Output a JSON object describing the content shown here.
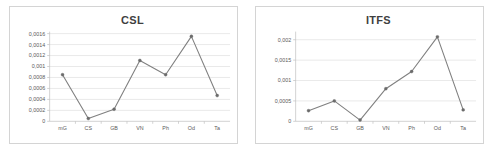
{
  "figure": {
    "panels": [
      "CSL",
      "ITFS"
    ],
    "decimal_separator": ",",
    "marker_color": "#6b6b6b",
    "line_color": "#808080",
    "gridline_color": "#d9d9d9",
    "border_color": "#d4d4d4"
  },
  "chart_data": [
    {
      "type": "line",
      "title": "CSL",
      "xlabel": "",
      "ylabel": "",
      "categories": [
        "mG",
        "CS",
        "GB",
        "VN",
        "Ph",
        "Od",
        "Ta"
      ],
      "values": [
        0.00085,
        5e-05,
        0.00022,
        0.00111,
        0.00085,
        0.00155,
        0.00047
      ],
      "ylim": [
        0,
        0.0016
      ],
      "ytick_values": [
        0,
        0.0002,
        0.0004,
        0.0006,
        0.0008,
        0.001,
        0.0012,
        0.0014,
        0.0016
      ],
      "ytick_labels": [
        "0",
        "0,0002",
        "0,0004",
        "0,0006",
        "0,0008",
        "0,001",
        "0,0012",
        "0,0014",
        "0,0016"
      ],
      "grid": true,
      "legend": false,
      "markers": true
    },
    {
      "type": "line",
      "title": "ITFS",
      "xlabel": "",
      "ylabel": "",
      "categories": [
        "mG",
        "CS",
        "GB",
        "VN",
        "Ph",
        "Od",
        "Ta"
      ],
      "values": [
        0.00026,
        0.0005,
        3e-05,
        0.0008,
        0.00122,
        0.00207,
        0.00028
      ],
      "ylim": [
        0,
        0.00215
      ],
      "ytick_values": [
        0,
        0.0005,
        0.001,
        0.0015,
        0.002
      ],
      "ytick_labels": [
        "0",
        "0,0005",
        "0,001",
        "0,0015",
        "0,002"
      ],
      "grid": true,
      "legend": false,
      "markers": true
    }
  ]
}
